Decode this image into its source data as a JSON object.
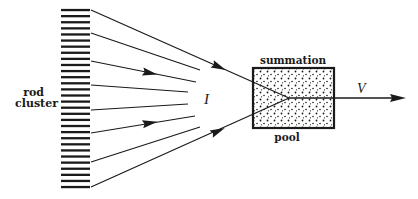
{
  "diagram": {
    "type": "schematic",
    "labels": {
      "rod_cluster_line1": "rod",
      "rod_cluster_line2": "cluster",
      "current": "I",
      "box_top": "summation",
      "box_bottom": "pool",
      "output": "V"
    },
    "rod_cluster": {
      "rod_count": 30,
      "x_left": 61,
      "x_right": 90,
      "y_top": 10,
      "y_bottom": 187
    },
    "fan_lines": [
      {
        "from": [
          91,
          10
        ],
        "to": [
          289,
          98
        ],
        "arrow_at": [
          219,
          67
        ],
        "clipped_at_box": true
      },
      {
        "from": [
          91,
          33
        ],
        "to": [
          200,
          70
        ],
        "arrow_at": null
      },
      {
        "from": [
          91,
          61
        ],
        "to": [
          196,
          82
        ],
        "arrow_at": [
          150,
          73
        ]
      },
      {
        "from": [
          91,
          85
        ],
        "to": [
          188,
          92
        ],
        "arrow_at": null
      },
      {
        "from": [
          91,
          110
        ],
        "to": [
          188,
          104
        ],
        "arrow_at": null
      },
      {
        "from": [
          91,
          133
        ],
        "to": [
          195,
          116
        ],
        "arrow_at": [
          150,
          123
        ]
      },
      {
        "from": [
          91,
          162
        ],
        "to": [
          200,
          127
        ],
        "arrow_at": null
      },
      {
        "from": [
          91,
          187
        ],
        "to": [
          289,
          98
        ],
        "arrow_at": [
          218,
          131
        ],
        "clipped_at_box": true
      }
    ],
    "summation_box": {
      "x": 253,
      "y": 68,
      "width": 81,
      "height": 60,
      "fill_pattern": "stipple"
    },
    "output_arrow": {
      "from": [
        289,
        98
      ],
      "to": [
        405,
        98
      ]
    },
    "colors": {
      "ink": "#1a1a1a",
      "background": "#ffffff"
    }
  }
}
